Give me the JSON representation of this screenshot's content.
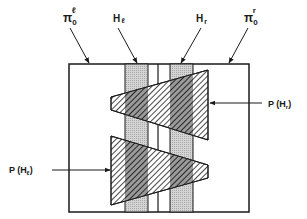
{
  "diagram": {
    "labels": {
      "pi_left": {
        "base": "π",
        "sub": "0",
        "sup": "ℓ"
      },
      "h_left": {
        "base": "H",
        "sub": "ℓ"
      },
      "h_right": {
        "base": "H",
        "sub": "r"
      },
      "pi_right": {
        "base": "π",
        "sub": "0",
        "sup": "r"
      },
      "p_h_right": {
        "prefix": "P (H",
        "sub": "r",
        "suffix": ")"
      },
      "p_h_left": {
        "prefix": "P (H",
        "sub": "ℓ",
        "suffix": ")"
      }
    },
    "colors": {
      "ink": "#1a1a1a",
      "band_gray": "#c8c8c8",
      "background": "#ffffff"
    },
    "regions": {
      "outer_box": "domain",
      "band_left": "H_l",
      "band_right": "H_r",
      "wedge_upper": "P(H_r)",
      "wedge_lower": "P(H_l)"
    }
  }
}
